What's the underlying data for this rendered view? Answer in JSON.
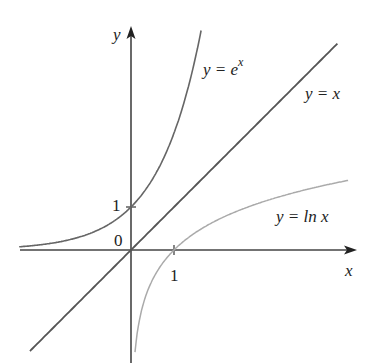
{
  "chart_data": {
    "type": "line",
    "title": "",
    "xlabel": "x",
    "ylabel": "y",
    "xlim": [
      -2.6,
      5.2
    ],
    "ylim": [
      -2.6,
      5.2
    ],
    "grid": false,
    "legend": "inline labels on curves",
    "origin_label": "0",
    "x_ticks": [
      {
        "value": 1,
        "label": "1"
      }
    ],
    "y_ticks": [
      {
        "value": 1,
        "label": "1"
      }
    ],
    "series": [
      {
        "name": "y = e^x",
        "label_main": "y = e",
        "label_sup": "x",
        "color": "#666666",
        "x": [
          -2.6,
          -2,
          -1.5,
          -1,
          -0.5,
          0,
          0.5,
          1,
          1.25,
          1.5,
          1.6
        ],
        "y": [
          0.07,
          0.14,
          0.22,
          0.37,
          0.61,
          1.0,
          1.65,
          2.72,
          3.49,
          4.48,
          4.95
        ]
      },
      {
        "name": "y = x",
        "label_main": "y = x",
        "color": "#555555",
        "x": [
          -2.35,
          4.8
        ],
        "y": [
          -2.35,
          4.8
        ]
      },
      {
        "name": "y = ln x",
        "label_main": "y = ln x",
        "color": "#aaaaaa",
        "x": [
          0.07,
          0.1,
          0.2,
          0.4,
          0.6,
          1,
          1.5,
          2,
          3,
          4,
          5.05
        ],
        "y": [
          -2.6,
          -2.3,
          -1.61,
          -0.92,
          -0.51,
          0,
          0.41,
          0.69,
          1.1,
          1.39,
          1.62
        ]
      }
    ]
  }
}
